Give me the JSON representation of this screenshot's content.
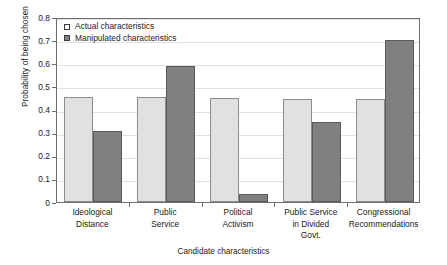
{
  "chart_data": {
    "type": "bar",
    "title": "",
    "xlabel": "Candidate characteristics",
    "ylabel": "Probability of being chosen",
    "ylim": [
      0,
      0.8
    ],
    "yticks": [
      "0",
      "0.1",
      "0.2",
      "0.3",
      "0.4",
      "0.5",
      "0.6",
      "0.7",
      "0.8"
    ],
    "ytick_values": [
      0,
      0.1,
      0.2,
      0.3,
      0.4,
      0.5,
      0.6,
      0.7,
      0.8
    ],
    "grid": true,
    "legend_position": "top-left",
    "categories": [
      "Ideological Distance",
      "Public Service",
      "Political Activism",
      "Public Service in Divided Govt.",
      "Congressional Recommendations"
    ],
    "category_lines": [
      [
        "Ideological",
        "Distance"
      ],
      [
        "Public",
        "Service"
      ],
      [
        "Political",
        "Activism"
      ],
      [
        "Public Service",
        "in Divided",
        "Govt."
      ],
      [
        "Congressional",
        "Recommendations"
      ]
    ],
    "series": [
      {
        "name": "Actual characteristics",
        "color": "#e1e1e1",
        "values": [
          0.455,
          0.452,
          0.45,
          0.447,
          0.445
        ]
      },
      {
        "name": "Manipulated characteristics",
        "color": "#808080",
        "values": [
          0.305,
          0.588,
          0.035,
          0.345,
          0.702
        ]
      }
    ]
  },
  "legend": {
    "items": [
      {
        "label": "Actual characteristics",
        "swatch": "legend-swatch-actual"
      },
      {
        "label": "Manipulated characteristics",
        "swatch": "legend-swatch-manipulated"
      }
    ]
  },
  "axes": {
    "y_title": "Probability of being chosen",
    "x_title": "Candidate characteristics"
  }
}
